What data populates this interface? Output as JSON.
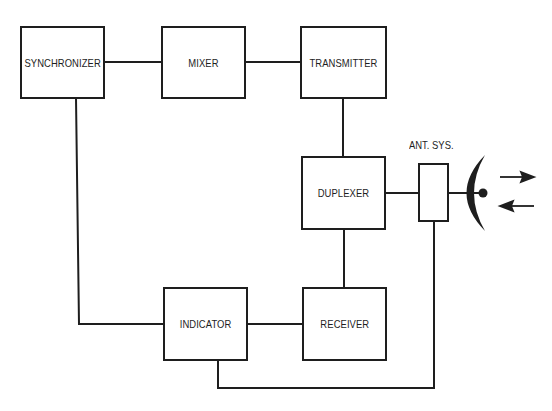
{
  "diagram": {
    "type": "block-diagram",
    "blocks": [
      {
        "id": "synchronizer",
        "label": "SYNCHRONIZER"
      },
      {
        "id": "mixer",
        "label": "MIXER"
      },
      {
        "id": "transmitter",
        "label": "TRANSMITTER"
      },
      {
        "id": "duplexer",
        "label": "DUPLEXER"
      },
      {
        "id": "indicator",
        "label": "INDICATOR"
      },
      {
        "id": "receiver",
        "label": "RECEIVER"
      },
      {
        "id": "antenna_system",
        "label": ""
      }
    ],
    "labels": {
      "antenna_system": "ANT. SYS."
    },
    "connections": [
      {
        "from": "synchronizer",
        "to": "mixer"
      },
      {
        "from": "mixer",
        "to": "transmitter"
      },
      {
        "from": "transmitter",
        "to": "duplexer"
      },
      {
        "from": "duplexer",
        "to": "antenna_system"
      },
      {
        "from": "duplexer",
        "to": "receiver"
      },
      {
        "from": "receiver",
        "to": "indicator"
      },
      {
        "from": "synchronizer",
        "to": "indicator"
      },
      {
        "from": "indicator",
        "to": "antenna_system"
      }
    ],
    "symbols": {
      "dish": "parabolic-antenna",
      "arrows": [
        "outgoing-right",
        "incoming-left"
      ]
    }
  }
}
